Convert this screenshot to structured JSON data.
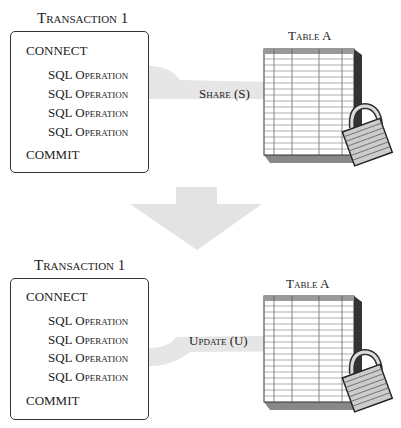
{
  "panels": [
    {
      "transaction_title": "Transaction 1",
      "connect": "CONNECT",
      "operations": [
        "SQL Operation",
        "SQL Operation",
        "SQL Operation",
        "SQL Operation"
      ],
      "highlighted_operation_index": 1,
      "commit": "COMMIT",
      "lock_label": "Share (S)",
      "table_title": "Table A"
    },
    {
      "transaction_title": "Transaction 1",
      "connect": "CONNECT",
      "operations": [
        "SQL Operation",
        "SQL Operation",
        "SQL Operation",
        "SQL Operation"
      ],
      "highlighted_operation_index": 2,
      "commit": "COMMIT",
      "lock_label": "Update (U)",
      "table_title": "Table A"
    }
  ],
  "colors": {
    "highlight_band": "#e6e6e6",
    "arrow": "#e3e3e3",
    "border": "#333333"
  }
}
